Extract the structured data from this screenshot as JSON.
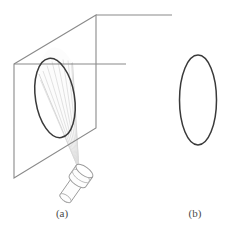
{
  "figure": {
    "background_color": "#ffffff",
    "width": 236,
    "height": 233,
    "panels": [
      {
        "id": "a",
        "caption": "(a)",
        "description": "A flashlight below and to the right emits a cone of light that strikes an inclined rectangular plane, and the illuminated region on the plane is an ellipse.",
        "elements": [
          {
            "name": "projection-plane",
            "type": "parallelogram",
            "stroke_color": "#8a8a8a",
            "stroke_width": 1,
            "points": [
              [
                14,
                64
              ],
              [
                96,
                15
              ],
              [
                96,
                128
              ],
              [
                14,
                178
              ]
            ]
          },
          {
            "name": "plane-top-edge-extension",
            "type": "line",
            "stroke_color": "#8a8a8a",
            "stroke_width": 1,
            "points": [
              [
                96,
                15
              ],
              [
                172,
                15
              ]
            ]
          },
          {
            "name": "plane-mid-horizontal-line",
            "type": "line",
            "stroke_color": "#8a8a8a",
            "stroke_width": 1,
            "points": [
              [
                14,
                64
              ],
              [
                126,
                64
              ]
            ]
          },
          {
            "name": "ellipse-on-plane",
            "type": "ellipse",
            "stroke_color": "#3a3a3a",
            "stroke_width": 1.4,
            "cx": 55,
            "cy": 98,
            "rx": 19.5,
            "ry": 40,
            "rotation_deg": -9
          },
          {
            "name": "light-cone",
            "type": "cone",
            "stroke_color": "#d0d0d0",
            "fill_color": "#fbfbfb",
            "apex": [
              79,
              170
            ],
            "ray_count": 9
          },
          {
            "name": "flashlight",
            "type": "cylinder-assembly",
            "stroke_color": "#9a9a9a",
            "fill_color": "#fcfcfc",
            "head_center": [
              79,
              172
            ],
            "body_angle_deg": 35
          }
        ]
      },
      {
        "id": "b",
        "caption": "(b)",
        "description": "The same ellipse drawn on its own, separated from the plane and the light cone.",
        "elements": [
          {
            "name": "ellipse-standalone",
            "type": "ellipse",
            "stroke_color": "#3a3a3a",
            "stroke_width": 1.4,
            "cx": 198,
            "cy": 100,
            "rx": 18.5,
            "ry": 45,
            "rotation_deg": 0
          }
        ]
      }
    ]
  },
  "colors": {
    "line_gray": "#8a8a8a",
    "ellipse_dark": "#3a3a3a",
    "ray_light": "#d6d6d6",
    "flashlight_gray": "#9a9a9a",
    "caption_text": "#4a4a4a",
    "background": "#ffffff"
  }
}
